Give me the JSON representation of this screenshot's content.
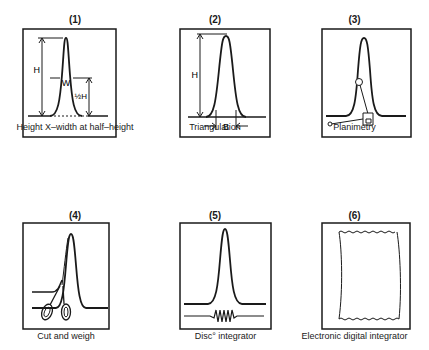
{
  "figure": {
    "panels": [
      {
        "number": "(1)",
        "caption": "Height X–width at half–height",
        "labels": {
          "height": "H",
          "width": "W",
          "half_height": "½H"
        }
      },
      {
        "number": "(2)",
        "caption": "Triangulation",
        "labels": {
          "height": "H",
          "base": "B"
        }
      },
      {
        "number": "(3)",
        "caption": "Planimetry"
      },
      {
        "number": "(4)",
        "caption": "Cut and weigh"
      },
      {
        "number": "(5)",
        "caption": "Disc° integrator"
      },
      {
        "number": "(6)",
        "caption": "Electronic digital integrator"
      }
    ]
  }
}
